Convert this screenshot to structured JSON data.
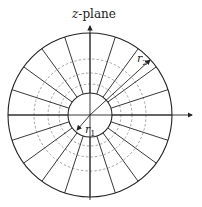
{
  "title": "z-plane",
  "labels": {
    "inner_radius": "r",
    "inner_sub": "1",
    "outer_radius": "r",
    "outer_sub": "2"
  },
  "geometry": {
    "center": [
      90,
      115
    ],
    "outer_radius": 82,
    "inner_radius": 22,
    "dashed_radii": [
      31,
      42,
      56
    ],
    "spoke_count": 20
  },
  "colors": {
    "line": "#222222",
    "dashed": "#999999",
    "background": "#ffffff"
  }
}
